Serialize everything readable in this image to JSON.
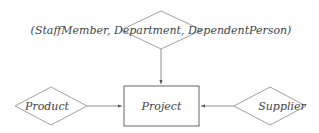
{
  "diagram": {
    "type": "entity-relationship",
    "colors": {
      "stroke": "#777777",
      "text": "#444444",
      "background": "#ffffff"
    },
    "entities": [
      {
        "id": "project",
        "label": "Project"
      }
    ],
    "relationships": [
      {
        "id": "top",
        "label": "(StaffMember, Department, DependentPerson)"
      },
      {
        "id": "product",
        "label": "Product"
      },
      {
        "id": "supplier",
        "label": "Supplier"
      }
    ],
    "edges": [
      {
        "from": "top",
        "to": "project"
      },
      {
        "from": "product",
        "to": "project"
      },
      {
        "from": "supplier",
        "to": "project"
      }
    ]
  }
}
